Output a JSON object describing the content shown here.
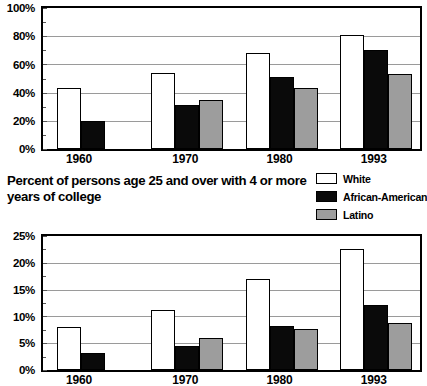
{
  "chart_title": "Percent of persons age 25 and over with 4 or more years of college",
  "legend": {
    "position": "top-right",
    "items": [
      {
        "label": "White",
        "swatch": "white",
        "color": "#ffffff"
      },
      {
        "label": "African-American",
        "swatch": "black",
        "color": "#0a0a0a"
      },
      {
        "label": "Latino",
        "swatch": "gray",
        "color": "#9d9d9d"
      }
    ]
  },
  "chart_data": [
    {
      "id": "top",
      "type": "bar",
      "title": "",
      "xlabel": "",
      "ylabel": "",
      "categories": [
        "1960",
        "1970",
        "1980",
        "1993"
      ],
      "series": [
        {
          "name": "White",
          "values": [
            43,
            54,
            68,
            81
          ]
        },
        {
          "name": "African-American",
          "values": [
            20,
            31,
            51,
            70
          ]
        },
        {
          "name": "Latino",
          "values": [
            null,
            35,
            43,
            53
          ]
        }
      ],
      "ylim": [
        0,
        100
      ],
      "yticks": [
        0,
        20,
        40,
        60,
        80,
        100
      ],
      "ytick_labels": [
        "0%",
        "20%",
        "40%",
        "60%",
        "80%",
        "100%"
      ],
      "grid": true,
      "legend_position": "above-right"
    },
    {
      "id": "bottom",
      "type": "bar",
      "title": "Percent of persons age 25 and over with 4 or more years of college",
      "xlabel": "",
      "ylabel": "",
      "categories": [
        "1960",
        "1970",
        "1980",
        "1993"
      ],
      "series": [
        {
          "name": "White",
          "values": [
            8.0,
            11.2,
            17.0,
            22.6
          ]
        },
        {
          "name": "African-American",
          "values": [
            3.2,
            4.5,
            8.3,
            12.2
          ]
        },
        {
          "name": "Latino",
          "values": [
            null,
            5.9,
            7.6,
            8.8
          ]
        }
      ],
      "ylim": [
        0,
        25
      ],
      "yticks": [
        0,
        5,
        10,
        15,
        20,
        25
      ],
      "ytick_labels": [
        "0%",
        "5%",
        "10%",
        "15%",
        "20%",
        "25%"
      ],
      "grid": true,
      "legend_position": "above-right"
    }
  ]
}
